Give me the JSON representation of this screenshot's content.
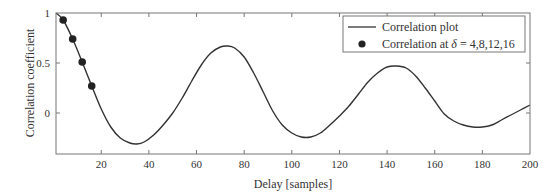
{
  "chart_data": {
    "type": "line",
    "title": "",
    "xlabel": "Delay [samples]",
    "ylabel": "Correlation coefficient",
    "xlim": [
      1,
      200
    ],
    "ylim": [
      -0.41,
      1
    ],
    "x_ticks": [
      20,
      40,
      60,
      80,
      100,
      120,
      140,
      160,
      180,
      200
    ],
    "y_ticks": [
      0,
      0.5,
      1
    ],
    "y_tick_labels": [
      "0",
      "0.5",
      "1"
    ],
    "grid": false,
    "legend_position": "upper right",
    "series": [
      {
        "name": "Correlation plot",
        "style": "line",
        "color": "#333333",
        "x": [
          1,
          4,
          8,
          12,
          16,
          20,
          24,
          28,
          32,
          35,
          38,
          42,
          46,
          50,
          54,
          58,
          62,
          66,
          70,
          73,
          76,
          80,
          84,
          88,
          92,
          96,
          100,
          104,
          108,
          112,
          116,
          120,
          124,
          128,
          132,
          136,
          140,
          144,
          148,
          152,
          156,
          160,
          164,
          168,
          172,
          176,
          180,
          184,
          188,
          192,
          196,
          200
        ],
        "y": [
          1.0,
          0.93,
          0.74,
          0.51,
          0.27,
          0.04,
          -0.14,
          -0.25,
          -0.3,
          -0.31,
          -0.29,
          -0.22,
          -0.12,
          0.0,
          0.15,
          0.32,
          0.48,
          0.6,
          0.66,
          0.67,
          0.65,
          0.56,
          0.4,
          0.21,
          0.02,
          -0.12,
          -0.2,
          -0.24,
          -0.24,
          -0.2,
          -0.12,
          -0.03,
          0.07,
          0.19,
          0.31,
          0.4,
          0.46,
          0.47,
          0.45,
          0.37,
          0.25,
          0.12,
          -0.01,
          -0.08,
          -0.12,
          -0.14,
          -0.14,
          -0.12,
          -0.07,
          -0.02,
          0.03,
          0.08
        ]
      },
      {
        "name": "Correlation at δ = 4,8,12,16",
        "style": "markers",
        "color": "#222222",
        "x": [
          4,
          8,
          12,
          16
        ],
        "y": [
          0.93,
          0.74,
          0.51,
          0.27
        ]
      }
    ],
    "legend": {
      "entries": [
        "Correlation plot",
        "Correlation at δ = 4,8,12,16"
      ],
      "entry_line_label": "Correlation plot",
      "entry_marker_prefix": "Correlation at ",
      "entry_marker_symbol": "δ",
      "entry_marker_suffix": " = 4,8,12,16"
    }
  }
}
